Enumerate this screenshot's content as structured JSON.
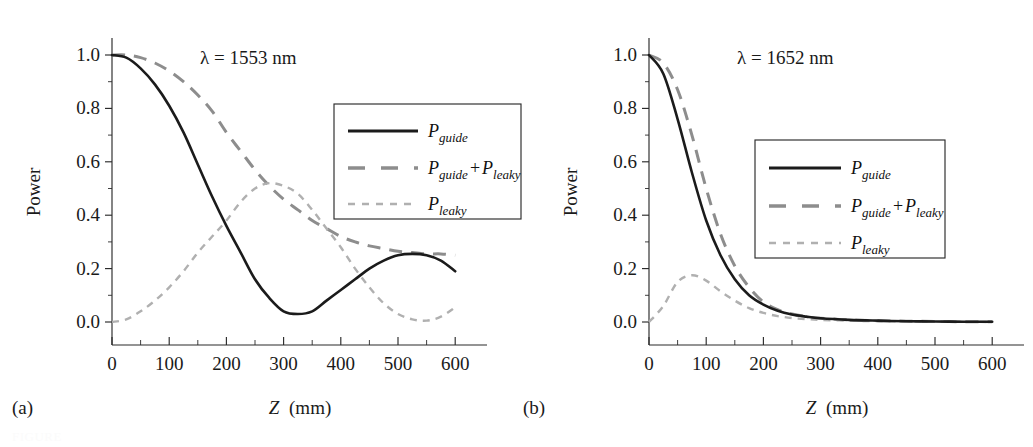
{
  "figure": {
    "background": "#ffffff",
    "width": 1033,
    "height": 447,
    "caption_fragment": "FIGURE"
  },
  "colors": {
    "guide": "#1b1b1b",
    "sum": "#8d8d8d",
    "leaky": "#b0b0b0",
    "axis": "#2b2b2b",
    "text": "#1a1a1a"
  },
  "panels": {
    "a": {
      "tag": "(a)",
      "annotation": "λ = 1553 nm",
      "wavelength_nm": 1553,
      "xlabel_symbol": "Z",
      "xlabel_unit": "(mm)",
      "ylabel": "Power",
      "xticks": [
        "0",
        "100",
        "200",
        "300",
        "400",
        "500",
        "600"
      ],
      "yticks": [
        "0.0",
        "0.2",
        "0.4",
        "0.6",
        "0.8",
        "1.0"
      ]
    },
    "b": {
      "tag": "(b)",
      "annotation": "λ = 1652 nm",
      "wavelength_nm": 1652,
      "xlabel_symbol": "Z",
      "xlabel_unit": "(mm)",
      "ylabel": "Power",
      "xticks": [
        "0",
        "100",
        "200",
        "300",
        "400",
        "500",
        "600"
      ],
      "yticks": [
        "0.0",
        "0.2",
        "0.4",
        "0.6",
        "0.8",
        "1.0"
      ]
    }
  },
  "legend": {
    "entries": [
      {
        "name": "p-guide",
        "base": "P",
        "sub": "guide",
        "style": "solid",
        "color": "#1b1b1b"
      },
      {
        "name": "p-guide-plus-p-leaky",
        "base": "P",
        "sub": "guide",
        "plus": "+",
        "base2": "P",
        "sub2": "leaky",
        "style": "dashed",
        "color": "#8d8d8d"
      },
      {
        "name": "p-leaky",
        "base": "P",
        "sub": "leaky",
        "style": "dotted",
        "color": "#b0b0b0"
      }
    ]
  },
  "chart_data": [
    {
      "type": "line",
      "title": "",
      "panel": "(a)",
      "annotation": "λ = 1553 nm",
      "xlabel": "Z (mm)",
      "ylabel": "Power",
      "xlim": [
        0,
        600
      ],
      "ylim": [
        0.0,
        1.0
      ],
      "xticks": [
        0,
        100,
        200,
        300,
        400,
        500,
        600
      ],
      "yticks": [
        0.0,
        0.2,
        0.4,
        0.6,
        0.8,
        1.0
      ],
      "minor_tick_x_step": 50,
      "minor_tick_y_step": 0.1,
      "grid": false,
      "legend_position": "upper-right-inside",
      "x": [
        0,
        25,
        50,
        75,
        100,
        125,
        150,
        175,
        200,
        225,
        250,
        275,
        300,
        325,
        350,
        375,
        400,
        425,
        450,
        475,
        500,
        525,
        550,
        575,
        600
      ],
      "series": [
        {
          "name": "P_guide",
          "style": "solid",
          "color": "#1b1b1b",
          "values": [
            1.0,
            0.99,
            0.95,
            0.89,
            0.81,
            0.71,
            0.59,
            0.47,
            0.36,
            0.26,
            0.16,
            0.09,
            0.04,
            0.03,
            0.04,
            0.08,
            0.12,
            0.16,
            0.2,
            0.23,
            0.25,
            0.255,
            0.25,
            0.23,
            0.19
          ]
        },
        {
          "name": "P_guide_plus_P_leaky",
          "style": "dashed",
          "color": "#8d8d8d",
          "values": [
            1.0,
            1.0,
            0.99,
            0.97,
            0.94,
            0.9,
            0.85,
            0.79,
            0.71,
            0.64,
            0.57,
            0.51,
            0.46,
            0.42,
            0.38,
            0.35,
            0.32,
            0.3,
            0.285,
            0.275,
            0.265,
            0.26,
            0.255,
            0.255,
            0.25
          ]
        },
        {
          "name": "P_leaky",
          "style": "dotted",
          "color": "#b0b0b0",
          "values": [
            0.0,
            0.01,
            0.04,
            0.08,
            0.13,
            0.19,
            0.26,
            0.32,
            0.38,
            0.45,
            0.5,
            0.52,
            0.51,
            0.48,
            0.42,
            0.35,
            0.28,
            0.2,
            0.13,
            0.07,
            0.03,
            0.01,
            0.005,
            0.02,
            0.055
          ]
        }
      ]
    },
    {
      "type": "line",
      "title": "",
      "panel": "(b)",
      "annotation": "λ = 1652 nm",
      "xlabel": "Z (mm)",
      "ylabel": "Power",
      "xlim": [
        0,
        600
      ],
      "ylim": [
        0.0,
        1.0
      ],
      "xticks": [
        0,
        100,
        200,
        300,
        400,
        500,
        600
      ],
      "yticks": [
        0.0,
        0.2,
        0.4,
        0.6,
        0.8,
        1.0
      ],
      "minor_tick_x_step": 50,
      "minor_tick_y_step": 0.1,
      "grid": false,
      "legend_position": "middle-right-inside",
      "x": [
        0,
        25,
        50,
        75,
        100,
        125,
        150,
        175,
        200,
        225,
        250,
        275,
        300,
        350,
        400,
        450,
        500,
        550,
        600
      ],
      "series": [
        {
          "name": "P_guide",
          "style": "solid",
          "color": "#1b1b1b",
          "values": [
            1.0,
            0.93,
            0.76,
            0.56,
            0.38,
            0.25,
            0.16,
            0.1,
            0.065,
            0.042,
            0.028,
            0.02,
            0.014,
            0.008,
            0.005,
            0.003,
            0.002,
            0.001,
            0.001
          ]
        },
        {
          "name": "P_guide_plus_P_leaky",
          "style": "dashed",
          "color": "#8d8d8d",
          "values": [
            1.0,
            0.97,
            0.87,
            0.7,
            0.5,
            0.33,
            0.21,
            0.13,
            0.075,
            0.046,
            0.03,
            0.02,
            0.014,
            0.008,
            0.005,
            0.003,
            0.002,
            0.001,
            0.001
          ]
        },
        {
          "name": "P_leaky",
          "style": "dotted",
          "color": "#b0b0b0",
          "values": [
            0.0,
            0.06,
            0.15,
            0.175,
            0.155,
            0.115,
            0.08,
            0.052,
            0.034,
            0.022,
            0.015,
            0.011,
            0.008,
            0.005,
            0.003,
            0.002,
            0.001,
            0.001,
            0.0
          ]
        }
      ]
    }
  ]
}
